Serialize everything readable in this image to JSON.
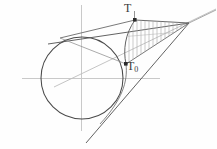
{
  "figure": {
    "background_color": "#fefefe",
    "width": 217,
    "height": 149,
    "colors": {
      "axis": "#c9c9c9",
      "circle": "#4a4a4a",
      "tangent": "#5a5a5a",
      "chord": "#6a6a6a",
      "hatch": "#a8a8a8",
      "ray": "#b4b4b4",
      "marker": "#2b2b2b",
      "label": "#3a3a3a"
    },
    "labels": [
      {
        "id": "T",
        "text": "T",
        "x": 124,
        "y": 2
      },
      {
        "id": "T0",
        "text": "T",
        "subscript": "0",
        "x": 127,
        "y": 60
      }
    ],
    "points": [
      {
        "name": "circle-center",
        "x": 82,
        "y": 78
      },
      {
        "name": "point-T",
        "x": 135,
        "y": 20
      },
      {
        "name": "point-T0",
        "x": 126,
        "y": 64
      },
      {
        "name": "apex",
        "x": 189,
        "y": 23
      },
      {
        "name": "upper-tangency",
        "x": 84,
        "y": 37
      },
      {
        "name": "lower-tangency",
        "x": 107,
        "y": 112
      }
    ],
    "geometry": {
      "circle_radius": 41,
      "axis_horizontal": {
        "x1": 22,
        "y1": 78,
        "x2": 160,
        "y2": 78
      },
      "axis_vertical": {
        "x1": 81,
        "y1": 5,
        "x2": 81,
        "y2": 131
      },
      "hatch_line_count": 17,
      "ray_slope_label": "center-to-apex ray"
    }
  }
}
